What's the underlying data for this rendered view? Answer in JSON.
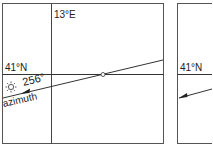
{
  "left_panel": {
    "longitude_label": "13°E",
    "latitude_label": "41°N",
    "azimuth_value": "256°",
    "azimuth_label": "azimuth",
    "sun_icon": "sun-icon"
  },
  "right_panel": {
    "latitude_label": "41°N"
  },
  "colors": {
    "line": "#333333",
    "text": "#222222",
    "background": "#ffffff"
  }
}
